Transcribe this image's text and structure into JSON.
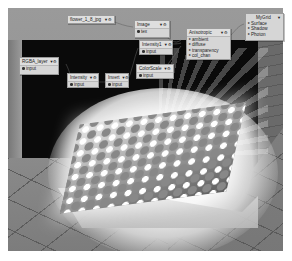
{
  "viewport": {
    "description": "3D render of patterned plane lit by spotlight inside dark box on tiled floor",
    "colors": {
      "background": "#8f8f8f",
      "box": "#0a0a0a",
      "node_fill": "#d6d6d6",
      "node_border": "#9a9a9a"
    }
  },
  "nodes": {
    "flower": {
      "title": "flower_1_8_jpg",
      "icon": "▼⚙",
      "ports": []
    },
    "image": {
      "title": "Image",
      "icon": "▼⚙",
      "ports": [
        "tex"
      ]
    },
    "intensity1": {
      "title": "Intensity1",
      "icon": "▼⚙",
      "ports": [
        "input"
      ]
    },
    "colorscale": {
      "title": "ColorScale",
      "icon": "▼⚙",
      "ports": [
        "input"
      ]
    },
    "anisotropic": {
      "title": "Anisotropic",
      "icon": "▼⚙",
      "ports": [
        "ambient",
        "diffuse",
        "transparency",
        "col_chan"
      ]
    },
    "mygrid": {
      "title": "MyGrid",
      "icon": "▼",
      "ports": [
        "Surface",
        "Shadow",
        "Photon"
      ]
    },
    "rgba_layer": {
      "title": "RGBA_layer",
      "icon": "▼⚙",
      "ports": [
        "input"
      ]
    },
    "intensity": {
      "title": "Intensity",
      "icon": "▼⚙",
      "ports": [
        "input"
      ]
    },
    "invert": {
      "title": "Invert",
      "icon": "▼⚙",
      "ports": [
        "input"
      ]
    }
  }
}
